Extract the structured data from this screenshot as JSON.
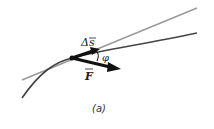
{
  "diagram": {
    "labels": {
      "displacement": "Δs",
      "force": "F",
      "angle": "φ",
      "caption": "(a)"
    },
    "colors": {
      "tangent_line": "#999999",
      "curve": "#444444",
      "vectors": "#111111"
    }
  }
}
